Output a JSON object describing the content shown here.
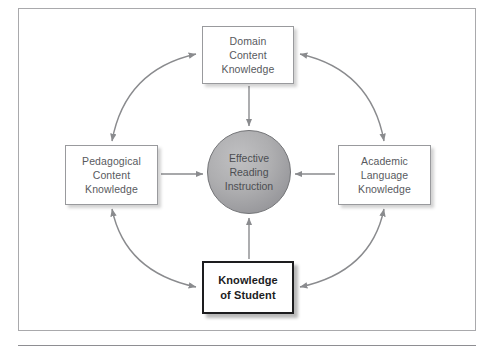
{
  "figure": {
    "type": "concept-diagram",
    "shape": "cyclical-hub-and-spoke",
    "center": {
      "id": "effective-reading-instruction",
      "label": "Effective\nReading\nInstruction",
      "shape": "circle",
      "fill_color": "#a8a8aa",
      "stroke_color": "#6f7073"
    },
    "nodes": [
      {
        "id": "domain-content-knowledge",
        "position": "top",
        "label": "Domain\nContent\nKnowledge",
        "emphasis": false,
        "border_color": "#999a9d",
        "text_color": "#585a5e"
      },
      {
        "id": "academic-language-knowledge",
        "position": "right",
        "label": "Academic\nLanguage\nKnowledge",
        "emphasis": false,
        "border_color": "#999a9d",
        "text_color": "#585a5e"
      },
      {
        "id": "knowledge-of-student",
        "position": "bottom",
        "label": "Knowledge\nof Student",
        "emphasis": true,
        "border_color": "#1d1d1f",
        "text_color": "#1c1c1e"
      },
      {
        "id": "pedagogical-content-knowledge",
        "position": "left",
        "label": "Pedagogical\nContent\nKnowledge",
        "emphasis": false,
        "border_color": "#999a9d",
        "text_color": "#585a5e"
      }
    ],
    "spoke_arrows": [
      {
        "id": "spoke-top",
        "from": "domain-content-knowledge",
        "to": "effective-reading-instruction",
        "direction": "inward"
      },
      {
        "id": "spoke-right",
        "from": "academic-language-knowledge",
        "to": "effective-reading-instruction",
        "direction": "inward"
      },
      {
        "id": "spoke-bottom",
        "from": "knowledge-of-student",
        "to": "effective-reading-instruction",
        "direction": "inward"
      },
      {
        "id": "spoke-left",
        "from": "pedagogical-content-knowledge",
        "to": "effective-reading-instruction",
        "direction": "inward"
      }
    ],
    "ring_arrows": [
      {
        "id": "ring-top-left",
        "between": [
          "pedagogical-content-knowledge",
          "domain-content-knowledge"
        ],
        "heads": "both"
      },
      {
        "id": "ring-top-right",
        "between": [
          "domain-content-knowledge",
          "academic-language-knowledge"
        ],
        "heads": "both"
      },
      {
        "id": "ring-bottom-right",
        "between": [
          "academic-language-knowledge",
          "knowledge-of-student"
        ],
        "heads": "both"
      },
      {
        "id": "ring-bottom-left",
        "between": [
          "knowledge-of-student",
          "pedagogical-content-knowledge"
        ],
        "heads": "both"
      }
    ],
    "colors": {
      "frame": "#a9a9ac",
      "arrow": "#8a8b8e",
      "background": "#ffffff",
      "rule": "#8e8e92"
    }
  }
}
